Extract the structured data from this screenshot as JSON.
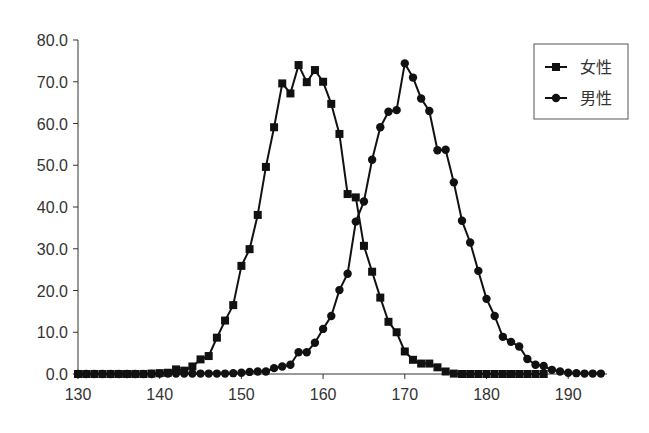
{
  "chart_data": {
    "type": "line",
    "title": "",
    "xlabel": "",
    "ylabel": "",
    "xlim": [
      130,
      195
    ],
    "ylim": [
      0,
      80
    ],
    "x_ticks": [
      130,
      140,
      150,
      160,
      170,
      180,
      190
    ],
    "y_ticks": [
      "0.0",
      "10.0",
      "20.0",
      "30.0",
      "40.0",
      "50.0",
      "60.0",
      "70.0",
      "80.0"
    ],
    "grid": false,
    "legend_position": "upper right",
    "series": [
      {
        "name": "女性",
        "marker": "square",
        "color": "#111111",
        "x": [
          130,
          131,
          132,
          133,
          134,
          135,
          136,
          137,
          138,
          139,
          140,
          141,
          142,
          143,
          144,
          145,
          146,
          147,
          148,
          149,
          150,
          151,
          152,
          153,
          154,
          155,
          156,
          157,
          158,
          159,
          160,
          161,
          162,
          163,
          164,
          165,
          166,
          167,
          168,
          169,
          170,
          171,
          172,
          173,
          174,
          175,
          176,
          177,
          178,
          179,
          180,
          181,
          182,
          183,
          184,
          185,
          186,
          187
        ],
        "values": [
          0,
          0,
          0,
          0,
          0,
          0,
          0,
          0,
          0,
          0.1,
          0.2,
          0.3,
          1.1,
          0.8,
          1.8,
          3.5,
          4.3,
          8.7,
          12.8,
          16.5,
          25.9,
          29.9,
          38.1,
          49.6,
          59.1,
          69.6,
          67.2,
          74.0,
          69.9,
          72.8,
          70.0,
          64.7,
          57.5,
          43.1,
          42.3,
          30.7,
          24.5,
          18.3,
          12.5,
          10.0,
          5.4,
          3.4,
          2.5,
          2.5,
          1.6,
          0.6,
          0.1,
          0,
          0,
          0,
          0,
          0,
          0,
          0,
          0,
          0,
          0,
          0
        ]
      },
      {
        "name": "男性",
        "marker": "circle",
        "color": "#111111",
        "x": [
          130,
          131,
          132,
          133,
          134,
          135,
          136,
          137,
          138,
          139,
          140,
          141,
          142,
          143,
          144,
          145,
          146,
          147,
          148,
          149,
          150,
          151,
          152,
          153,
          154,
          155,
          156,
          157,
          158,
          159,
          160,
          161,
          162,
          163,
          164,
          165,
          166,
          167,
          168,
          169,
          170,
          171,
          172,
          173,
          174,
          175,
          176,
          177,
          178,
          179,
          180,
          181,
          182,
          183,
          184,
          185,
          186,
          187,
          188,
          189,
          190,
          191,
          192,
          193,
          194
        ],
        "values": [
          0,
          0,
          0,
          0,
          0,
          0,
          0,
          0,
          0,
          0,
          0.1,
          0.1,
          0.1,
          0.1,
          0.1,
          0.1,
          0.1,
          0.1,
          0.1,
          0.2,
          0.3,
          0.5,
          0.6,
          0.6,
          1.4,
          1.8,
          2.2,
          5.2,
          5.2,
          7.5,
          10.8,
          13.9,
          20.1,
          24.0,
          36.5,
          41.3,
          51.3,
          59.1,
          62.8,
          63.2,
          74.4,
          71.0,
          66.0,
          63.0,
          53.6,
          53.7,
          45.9,
          36.7,
          31.5,
          24.7,
          18.0,
          13.9,
          8.9,
          7.7,
          6.6,
          3.6,
          2.2,
          1.9,
          1.0,
          0.6,
          0.3,
          0.2,
          0.1,
          0.1,
          0.1
        ]
      }
    ]
  },
  "legend": {
    "items": [
      {
        "label": "女性",
        "marker": "square"
      },
      {
        "label": "男性",
        "marker": "circle"
      }
    ]
  },
  "axes": {
    "x_tick_labels": [
      "130",
      "140",
      "150",
      "160",
      "170",
      "180",
      "190"
    ],
    "y_tick_labels": [
      "0.0",
      "10.0",
      "20.0",
      "30.0",
      "40.0",
      "50.0",
      "60.0",
      "70.0",
      "80.0"
    ]
  }
}
